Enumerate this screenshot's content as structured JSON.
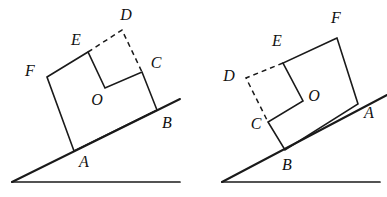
{
  "figure": {
    "stroke_color": "#1a1a1a",
    "background_color": "#ffffff",
    "label_color": "#111111",
    "left_figure": {
      "name": "left-inclined-block",
      "labels": {
        "A": "A",
        "B": "B",
        "C": "C",
        "D": "D",
        "E": "E",
        "F": "F",
        "O": "O"
      },
      "label_positions": {
        "A": {
          "x": 84,
          "y": 163
        },
        "B": {
          "x": 167,
          "y": 124
        },
        "C": {
          "x": 156,
          "y": 64
        },
        "D": {
          "x": 126,
          "y": 16
        },
        "E": {
          "x": 76,
          "y": 41
        },
        "F": {
          "x": 30,
          "y": 72
        },
        "O": {
          "x": 97,
          "y": 101
        }
      },
      "vertices": {
        "A": {
          "x": 74,
          "y": 151
        },
        "B": {
          "x": 157,
          "y": 110
        },
        "C": {
          "x": 142,
          "y": 72
        },
        "D": {
          "x": 122,
          "y": 30
        },
        "E": {
          "x": 88,
          "y": 52
        },
        "F": {
          "x": 47,
          "y": 77
        },
        "O": {
          "x": 105,
          "y": 88
        }
      },
      "solid_outline": "F,E,O,C,B,A",
      "dashed_outline": "E,D,C",
      "incline_line": {
        "x1": 12,
        "y1": 182,
        "x2": 180,
        "y2": 99
      },
      "base_line": {
        "x1": 12,
        "y1": 182,
        "x2": 180,
        "y2": 182
      }
    },
    "right_figure": {
      "name": "right-inclined-block",
      "labels": {
        "A": "A",
        "B": "B",
        "C": "C",
        "D": "D",
        "E": "E",
        "F": "F",
        "O": "O"
      },
      "label_positions": {
        "A": {
          "x": 369,
          "y": 114
        },
        "B": {
          "x": 287,
          "y": 166
        },
        "C": {
          "x": 256,
          "y": 125
        },
        "D": {
          "x": 229,
          "y": 77
        },
        "E": {
          "x": 277,
          "y": 42
        },
        "F": {
          "x": 336,
          "y": 19
        },
        "O": {
          "x": 314,
          "y": 97
        }
      },
      "vertices": {
        "A": {
          "x": 358,
          "y": 104
        },
        "B": {
          "x": 285,
          "y": 150
        },
        "C": {
          "x": 268,
          "y": 122
        },
        "D": {
          "x": 246,
          "y": 78
        },
        "E": {
          "x": 283,
          "y": 63
        },
        "F": {
          "x": 337,
          "y": 38
        },
        "O": {
          "x": 303,
          "y": 101
        }
      },
      "solid_outline": "F,E,O,C,B,A",
      "dashed_outline": "E,D,C",
      "incline_line": {
        "x1": 222,
        "y1": 182,
        "x2": 387,
        "y2": 95
      },
      "base_line": {
        "x1": 222,
        "y1": 182,
        "x2": 380,
        "y2": 182
      }
    }
  }
}
